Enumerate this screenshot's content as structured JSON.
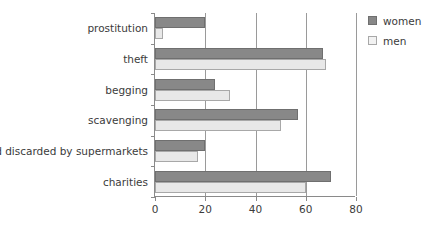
{
  "chart_data": {
    "type": "bar",
    "orientation": "horizontal",
    "title": "",
    "xlabel": "",
    "ylabel": "",
    "categories": [
      "prostitution",
      "theft",
      "begging",
      "scavenging",
      "food discarded by supermarkets",
      "charities"
    ],
    "series": [
      {
        "name": "women",
        "color": "#888888",
        "values": [
          20,
          67,
          24,
          57,
          20,
          70
        ]
      },
      {
        "name": "men",
        "color": "#e8e8e8",
        "values": [
          3,
          68,
          30,
          50,
          17,
          60
        ]
      }
    ],
    "xlim": [
      0,
      80
    ],
    "xticks": [
      0,
      20,
      40,
      60,
      80
    ],
    "xtick_labels": [
      "0",
      "20",
      "40",
      "60",
      "80"
    ],
    "grid": true,
    "grid_axis": "x",
    "legend": {
      "position": "right-top",
      "entries": [
        {
          "label": "women",
          "color": "#888888"
        },
        {
          "label": "men",
          "color": "#f2f2f2"
        }
      ]
    }
  },
  "colors": {
    "women": "#888888",
    "men": "#e8e8e8",
    "axis": "#8a8a8a",
    "grid": "#9a9a9a",
    "text": "#3b3b3b",
    "background": "#ffffff"
  }
}
